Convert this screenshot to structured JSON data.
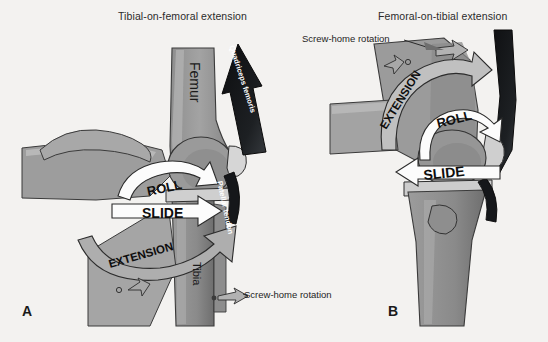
{
  "figure": {
    "background_color": "#f3f2f0",
    "panels": [
      {
        "letter": "A",
        "title": "Tibial-on-femoral extension",
        "bone_labels": [
          "Femur",
          "Tibia"
        ],
        "soft_tissue_labels": [
          "Quadriceps femoris",
          "Patellar tendon"
        ],
        "motion_arrows": [
          {
            "label": "ROLL",
            "style": "curved-white",
            "direction": "clockwise-right"
          },
          {
            "label": "SLIDE",
            "style": "straight-white",
            "direction": "right"
          },
          {
            "label": "EXTENSION",
            "style": "curved-grey-wide",
            "direction": "up-right"
          }
        ],
        "callout": "Screw-home rotation"
      },
      {
        "letter": "B",
        "title": "Femoral-on-tibial extension",
        "bone_labels": [],
        "soft_tissue_labels": [],
        "motion_arrows": [
          {
            "label": "ROLL",
            "style": "curved-white",
            "direction": "clockwise-down"
          },
          {
            "label": "SLIDE",
            "style": "straight-white",
            "direction": "left"
          },
          {
            "label": "EXTENSION",
            "style": "curved-grey-wide",
            "direction": "up-right"
          }
        ],
        "callout": "Screw-home rotation"
      }
    ],
    "colors": {
      "bone_mid": "#9a9a9a",
      "bone_light": "#b9b9b9",
      "bone_dark": "#7c7c7c",
      "cartilage": "#d2d2d2",
      "tendon_dark": "#16181a",
      "arrow_white": "#fdfdfd",
      "arrow_grey": "#adadad",
      "outline": "#2a2a2a",
      "text": "#1e1e1e"
    },
    "titles": {
      "panel_a": "Tibial-on-femoral extension",
      "panel_b": "Femoral-on-tibial extension"
    },
    "labels": {
      "femur": "Femur",
      "tibia": "Tibia",
      "quadriceps": "Quadriceps femoris",
      "patellar_tendon": "Patellar tendon",
      "roll": "ROLL",
      "slide": "SLIDE",
      "extension": "EXTENSION",
      "screw_home": "Screw-home rotation",
      "letter_a": "A",
      "letter_b": "B"
    }
  }
}
